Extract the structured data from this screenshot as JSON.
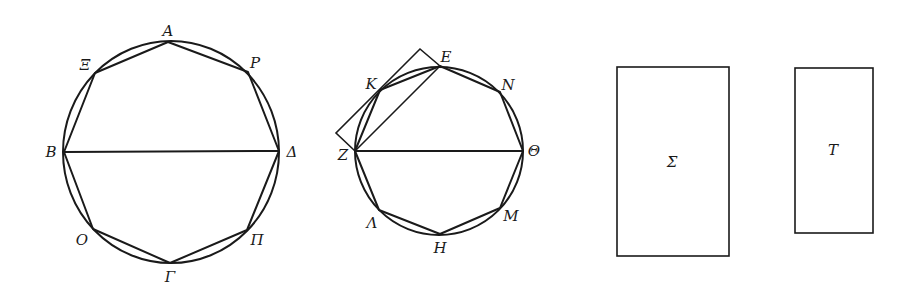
{
  "figure1": {
    "circle": {
      "cx": 171,
      "cy": 152,
      "rx": 108,
      "ry": 111
    },
    "polygon": [
      [
        168,
        42
      ],
      [
        248,
        72
      ],
      [
        279,
        151
      ],
      [
        247,
        230
      ],
      [
        170,
        263
      ],
      [
        93,
        229
      ],
      [
        64,
        152
      ],
      [
        95,
        73
      ]
    ],
    "diameter": [
      [
        64,
        152
      ],
      [
        279,
        151
      ]
    ],
    "labels": [
      {
        "text": "A",
        "x": 168,
        "y": 36
      },
      {
        "text": "Ρ",
        "x": 255,
        "y": 68
      },
      {
        "text": "Δ",
        "x": 292,
        "y": 157
      },
      {
        "text": "Π",
        "x": 257,
        "y": 245
      },
      {
        "text": "Γ",
        "x": 170,
        "y": 282
      },
      {
        "text": "Ο",
        "x": 82,
        "y": 245
      },
      {
        "text": "Β",
        "x": 51,
        "y": 157
      },
      {
        "text": "Ξ",
        "x": 85,
        "y": 70
      }
    ]
  },
  "figure2": {
    "circle": {
      "cx": 439,
      "cy": 151,
      "rx": 84,
      "ry": 84
    },
    "polygon": [
      [
        440,
        66
      ],
      [
        500,
        92
      ],
      [
        523,
        151
      ],
      [
        500,
        208
      ],
      [
        440,
        234
      ],
      [
        379,
        210
      ],
      [
        355,
        151
      ],
      [
        380,
        90
      ]
    ],
    "diameter": [
      [
        355,
        151
      ],
      [
        523,
        151
      ]
    ],
    "chord_ZE": [
      [
        355,
        151
      ],
      [
        440,
        66
      ]
    ],
    "square": [
      [
        355,
        151
      ],
      [
        336,
        133
      ],
      [
        420,
        49
      ],
      [
        440,
        66
      ]
    ],
    "labels": [
      {
        "text": "E",
        "x": 446,
        "y": 62
      },
      {
        "text": "N",
        "x": 508,
        "y": 90
      },
      {
        "text": "Θ",
        "x": 534,
        "y": 156
      },
      {
        "text": "Μ",
        "x": 511,
        "y": 221
      },
      {
        "text": "Η",
        "x": 440,
        "y": 253
      },
      {
        "text": "Λ",
        "x": 372,
        "y": 228
      },
      {
        "text": "Ζ",
        "x": 343,
        "y": 160
      },
      {
        "text": "Κ",
        "x": 371,
        "y": 89
      }
    ]
  },
  "rect_sigma": {
    "x": 617,
    "y": 67,
    "width": 112,
    "height": 189,
    "label": "Σ",
    "label_x": 672,
    "label_y": 167
  },
  "rect_tau": {
    "x": 795,
    "y": 68,
    "width": 78,
    "height": 165,
    "label": "Τ",
    "label_x": 833,
    "label_y": 155
  }
}
